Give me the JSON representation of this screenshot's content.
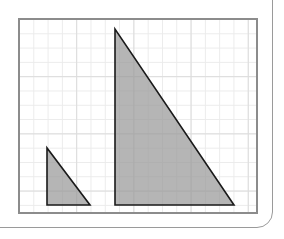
{
  "figure": {
    "background_color": "#ffffff",
    "outer_card": {
      "border_color": "#9a9a9a",
      "corner_radius": "16px"
    },
    "grid": {
      "frame_border_color": "#8c8c8c",
      "frame_border_width": 2.2,
      "frame_x": 18,
      "frame_y": 18,
      "frame_width": 240,
      "frame_height": 196,
      "minor_line_color": "#ebebeb",
      "major_line_color": "#dcdcdc",
      "cell_size": 14.3,
      "major_every": 4,
      "columns": 16,
      "rows": 13,
      "gridlines_visible": true
    },
    "shapes": [
      {
        "name": "small-triangle",
        "label": "Small right triangle",
        "type": "right-triangle",
        "fill_color": "#999999",
        "fill_opacity": 0.72,
        "stroke_color": "#1a1a1a",
        "stroke_width": 1.6,
        "right_angle_corner": "bottom-left",
        "base_cells": 3,
        "height_cells": 4,
        "points_px": "27,128 27,185 70,185",
        "vertices_px": [
          {
            "x": 27,
            "y": 128
          },
          {
            "x": 27,
            "y": 185
          },
          {
            "x": 70,
            "y": 185
          }
        ]
      },
      {
        "name": "large-triangle",
        "label": "Large right triangle",
        "type": "right-triangle",
        "fill_color": "#999999",
        "fill_opacity": 0.72,
        "stroke_color": "#1a1a1a",
        "stroke_width": 1.6,
        "right_angle_corner": "bottom-left",
        "base_cells": 8.3,
        "height_cells": 12.3,
        "points_px": "95,9 95,185 214,185",
        "vertices_px": [
          {
            "x": 95,
            "y": 9
          },
          {
            "x": 95,
            "y": 185
          },
          {
            "x": 214,
            "y": 185
          }
        ]
      }
    ]
  },
  "chart_data": {
    "type": "scatter",
    "xlabel": "",
    "ylabel": "",
    "xlim": [
      0,
      16
    ],
    "ylim": [
      0,
      13
    ],
    "grid": true,
    "legend": "none",
    "series": [
      {
        "name": "Small right triangle",
        "closed": true,
        "x": [
          0.6,
          0.6,
          3.6
        ],
        "y": [
          4.0,
          0.0,
          0.0
        ],
        "base": 3,
        "height": 4,
        "hypotenuse": 5
      },
      {
        "name": "Large right triangle",
        "closed": true,
        "x": [
          5.4,
          5.4,
          13.7
        ],
        "y": [
          12.3,
          0.0,
          0.0
        ],
        "base": 8.3,
        "height": 12.3,
        "hypotenuse": 14.8
      }
    ]
  }
}
